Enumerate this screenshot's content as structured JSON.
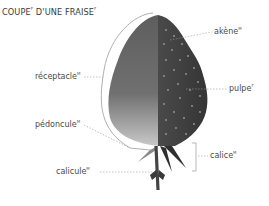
{
  "title": {
    "text": "COUPE",
    "mark1": "F",
    "text2": " D'UNE FRAISE",
    "mark2": "F"
  },
  "labels": [
    {
      "id": "akene",
      "text": "akène",
      "gender": "M"
    },
    {
      "id": "pulpe",
      "text": "pulpe",
      "gender": "F"
    },
    {
      "id": "receptacle",
      "text": "réceptacle",
      "gender": "M"
    },
    {
      "id": "pedoncule",
      "text": "pédoncule",
      "gender": "M"
    },
    {
      "id": "calice",
      "text": "calice",
      "gender": "M"
    },
    {
      "id": "calicule",
      "text": "calicule",
      "gender": "M"
    }
  ],
  "colors": {
    "cut_section": "#6b6b6b",
    "exterior": "#3e3e3e",
    "achene_dots": "#9a9a9a",
    "leader_lines": "#9a9a9a",
    "text": "#4a4a4a"
  }
}
